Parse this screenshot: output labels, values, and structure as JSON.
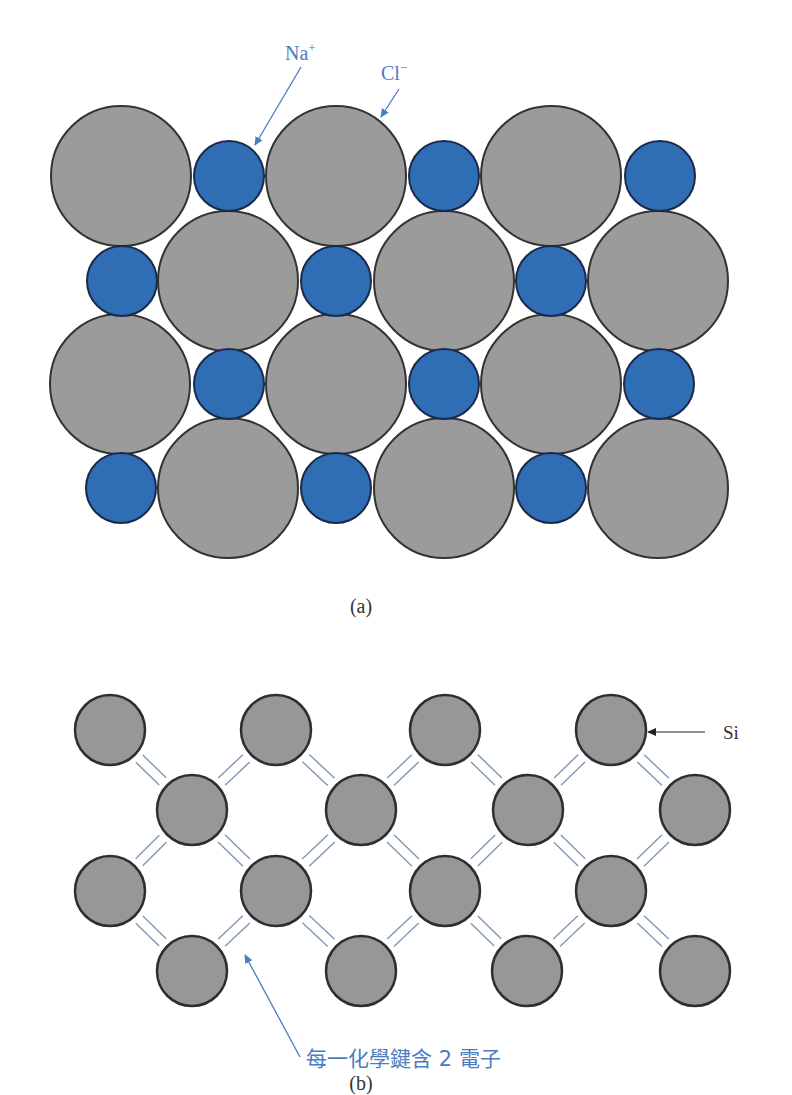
{
  "figure_a": {
    "caption": "(a)",
    "labels": {
      "na": "Na",
      "na_charge": "+",
      "cl": "Cl",
      "cl_charge": "−"
    },
    "colors": {
      "cl_fill": "#9b9b9b",
      "na_fill": "#2f6db5",
      "outline": "#333333",
      "annotation": "#4a7cc0"
    },
    "ions": [
      {
        "type": "Cl",
        "x": 121,
        "y": 176
      },
      {
        "type": "Na",
        "x": 229,
        "y": 176
      },
      {
        "type": "Cl",
        "x": 336,
        "y": 176
      },
      {
        "type": "Na",
        "x": 444,
        "y": 176
      },
      {
        "type": "Cl",
        "x": 551,
        "y": 176
      },
      {
        "type": "Na",
        "x": 660,
        "y": 176
      },
      {
        "type": "Na",
        "x": 122,
        "y": 281
      },
      {
        "type": "Cl",
        "x": 228,
        "y": 281
      },
      {
        "type": "Na",
        "x": 336,
        "y": 281
      },
      {
        "type": "Cl",
        "x": 444,
        "y": 281
      },
      {
        "type": "Na",
        "x": 551,
        "y": 281
      },
      {
        "type": "Cl",
        "x": 658,
        "y": 281
      },
      {
        "type": "Cl",
        "x": 120,
        "y": 384
      },
      {
        "type": "Na",
        "x": 229,
        "y": 384
      },
      {
        "type": "Cl",
        "x": 336,
        "y": 384
      },
      {
        "type": "Na",
        "x": 444,
        "y": 384
      },
      {
        "type": "Cl",
        "x": 551,
        "y": 384
      },
      {
        "type": "Na",
        "x": 659,
        "y": 384
      },
      {
        "type": "Na",
        "x": 121,
        "y": 488
      },
      {
        "type": "Cl",
        "x": 228,
        "y": 488
      },
      {
        "type": "Na",
        "x": 336,
        "y": 488
      },
      {
        "type": "Cl",
        "x": 444,
        "y": 488
      },
      {
        "type": "Na",
        "x": 551,
        "y": 488
      },
      {
        "type": "Cl",
        "x": 658,
        "y": 488
      }
    ]
  },
  "figure_b": {
    "caption": "(b)",
    "si_label": "Si",
    "bond_caption": "每一化學鍵含 2 電子",
    "colors": {
      "si_fill": "#979797",
      "outline": "#2e2e2e",
      "bond": "#7f97b8",
      "annotation": "#4a7cc0",
      "arrow_black": "#222222"
    },
    "atoms": [
      {
        "x": 110,
        "y": 730
      },
      {
        "x": 276,
        "y": 730
      },
      {
        "x": 445,
        "y": 730
      },
      {
        "x": 611,
        "y": 730
      },
      {
        "x": 192,
        "y": 810
      },
      {
        "x": 361,
        "y": 810
      },
      {
        "x": 528,
        "y": 810
      },
      {
        "x": 695,
        "y": 810
      },
      {
        "x": 110,
        "y": 891
      },
      {
        "x": 276,
        "y": 891
      },
      {
        "x": 445,
        "y": 891
      },
      {
        "x": 611,
        "y": 891
      },
      {
        "x": 192,
        "y": 971
      },
      {
        "x": 361,
        "y": 971
      },
      {
        "x": 527,
        "y": 971
      },
      {
        "x": 695,
        "y": 971
      }
    ]
  }
}
